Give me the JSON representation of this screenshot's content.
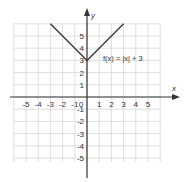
{
  "chart_data": {
    "type": "line",
    "title": "",
    "equation_label": "f(x) = |x| + 3",
    "xlabel": "x",
    "ylabel": "y",
    "xlim": [
      -6,
      6
    ],
    "ylim": [
      -6,
      6
    ],
    "grid": true,
    "x_ticks": [
      "-5",
      "-4",
      "-3",
      "-2",
      "-1",
      "0",
      "1",
      "2",
      "3",
      "4",
      "5"
    ],
    "y_ticks": [
      "5",
      "4",
      "3",
      "2",
      "1",
      "-1",
      "-2",
      "-3",
      "-4",
      "-5"
    ],
    "series": [
      {
        "name": "f(x) = |x| + 3",
        "x": [
          -3,
          0,
          3
        ],
        "y": [
          6,
          3,
          6
        ]
      }
    ],
    "vertex": [
      0,
      3
    ]
  }
}
